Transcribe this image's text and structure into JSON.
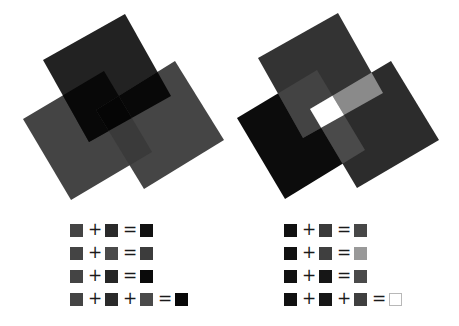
{
  "figures": [
    {
      "id": "subtractive",
      "description": "three overlapping rotated squares, overlaps become darker",
      "squares": [
        {
          "name": "left-square",
          "color": "#444444",
          "points": [
            [
              23,
              119
            ],
            [
              104,
              71
            ],
            [
              152,
              152
            ],
            [
              71,
              200
            ]
          ]
        },
        {
          "name": "top-square",
          "color": "#222222",
          "points": [
            [
              125,
              14
            ],
            [
              171,
              96
            ],
            [
              89,
              142
            ],
            [
              43,
              60
            ]
          ]
        },
        {
          "name": "right-square",
          "color": "#454545",
          "points": [
            [
              175,
              61
            ],
            [
              224,
              140
            ],
            [
              144,
              189
            ],
            [
              96,
              110
            ]
          ]
        }
      ],
      "overlaps": {
        "top_left": "#080808",
        "top_right": "#080808",
        "left_right": "#3a3a3a",
        "all": "#050505"
      }
    },
    {
      "id": "additive",
      "description": "three overlapping rotated squares, overlaps become lighter",
      "squares": [
        {
          "name": "left-square",
          "color": "#0c0c0c",
          "points": [
            [
              237,
              118
            ],
            [
              317,
              70
            ],
            [
              365,
              150
            ],
            [
              285,
              199
            ]
          ]
        },
        {
          "name": "top-square",
          "color": "#333333",
          "points": [
            [
              338,
              13
            ],
            [
              383,
              93
            ],
            [
              303,
              138
            ],
            [
              258,
              58
            ]
          ]
        },
        {
          "name": "right-square",
          "color": "#2c2c2c",
          "points": [
            [
              391,
              61
            ],
            [
              439,
              140
            ],
            [
              357,
              188
            ],
            [
              310,
              109
            ]
          ]
        }
      ],
      "overlaps": {
        "top_left": "#434343",
        "top_right": "#8a8a8a",
        "left_right": "#4a4a4a",
        "all": "#ffffff"
      }
    }
  ],
  "equations": {
    "left": [
      {
        "terms": [
          "#444444",
          "#2a2a2a"
        ],
        "ops": [
          "+",
          "="
        ],
        "result": "#111111",
        "result_outlined": false
      },
      {
        "terms": [
          "#444444",
          "#4a4a4a"
        ],
        "ops": [
          "+",
          "="
        ],
        "result": "#3c3c3c",
        "result_outlined": false
      },
      {
        "terms": [
          "#444444",
          "#262626"
        ],
        "ops": [
          "+",
          "="
        ],
        "result": "#0a0a0a",
        "result_outlined": false
      },
      {
        "terms": [
          "#444444",
          "#2a2a2a",
          "#4a4a4a"
        ],
        "ops": [
          "+",
          "+",
          "="
        ],
        "result": "#080808",
        "result_outlined": false
      }
    ],
    "right": [
      {
        "terms": [
          "#111111",
          "#3a3a3a"
        ],
        "ops": [
          "+",
          "="
        ],
        "result": "#474747",
        "result_outlined": false
      },
      {
        "terms": [
          "#111111",
          "#3f3f3f"
        ],
        "ops": [
          "+",
          "="
        ],
        "result": "#999999",
        "result_outlined": false
      },
      {
        "terms": [
          "#111111",
          "#161616"
        ],
        "ops": [
          "+",
          "="
        ],
        "result": "#4a4a4a",
        "result_outlined": false
      },
      {
        "terms": [
          "#111111",
          "#161616",
          "#3f3f3f"
        ],
        "ops": [
          "+",
          "+",
          "="
        ],
        "result": "#ffffff",
        "result_outlined": true
      }
    ]
  },
  "layout": {
    "left_panel_x": 70,
    "right_panel_x": 284,
    "row_y": [
      0,
      23,
      46,
      69
    ]
  }
}
